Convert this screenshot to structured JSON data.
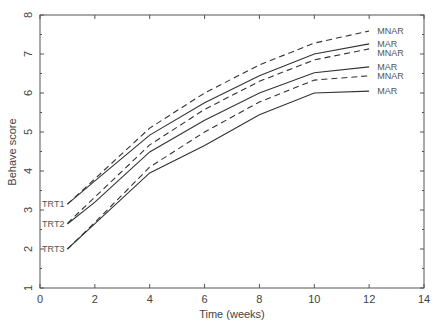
{
  "chart_data": {
    "type": "line",
    "title": "",
    "xlabel": "Time (weeks)",
    "ylabel": "Behave score",
    "xlim": [
      0,
      14
    ],
    "ylim": [
      1,
      8
    ],
    "xticks": [
      0,
      2,
      4,
      6,
      8,
      10,
      12,
      14
    ],
    "yticks": [
      1,
      2,
      3,
      4,
      5,
      6,
      7,
      8
    ],
    "grid": false,
    "legend": "inline labels at line ends",
    "x": [
      1,
      2,
      4,
      6,
      8,
      10,
      12
    ],
    "series": [
      {
        "name": "TRT1 MNAR",
        "group": "TRT1",
        "style": "dashed",
        "end_label": "MNAR",
        "values": [
          3.15,
          3.8,
          5.1,
          6.0,
          6.72,
          7.28,
          7.59
        ]
      },
      {
        "name": "TRT1 MAR",
        "group": "TRT1",
        "style": "solid",
        "end_label": "MAR",
        "values": [
          3.15,
          3.75,
          4.92,
          5.75,
          6.44,
          7.0,
          7.26
        ]
      },
      {
        "name": "TRT2 MNAR",
        "group": "TRT2",
        "style": "dashed",
        "end_label": "MNAR",
        "values": [
          2.66,
          3.33,
          4.67,
          5.58,
          6.3,
          6.85,
          7.13
        ]
      },
      {
        "name": "TRT2 MAR",
        "group": "TRT2",
        "style": "solid",
        "end_label": "MAR",
        "values": [
          2.64,
          3.2,
          4.49,
          5.3,
          6.0,
          6.52,
          6.67
        ]
      },
      {
        "name": "TRT3 MNAR",
        "group": "TRT3",
        "style": "dashed",
        "end_label": "MNAR",
        "values": [
          2.0,
          2.68,
          4.1,
          5.0,
          5.77,
          6.33,
          6.44
        ]
      },
      {
        "name": "TRT3 MAR",
        "group": "TRT3",
        "style": "solid",
        "end_label": "MAR",
        "values": [
          2.0,
          2.65,
          3.95,
          4.65,
          5.44,
          6.0,
          6.05
        ]
      }
    ],
    "start_labels": [
      {
        "text": "TRT1",
        "y": 3.15
      },
      {
        "text": "TRT2",
        "y": 2.65
      },
      {
        "text": "TRT3",
        "y": 2.0
      }
    ],
    "colors": {
      "line": "#333333",
      "axis": "#555555",
      "background": "#ffffff"
    }
  }
}
